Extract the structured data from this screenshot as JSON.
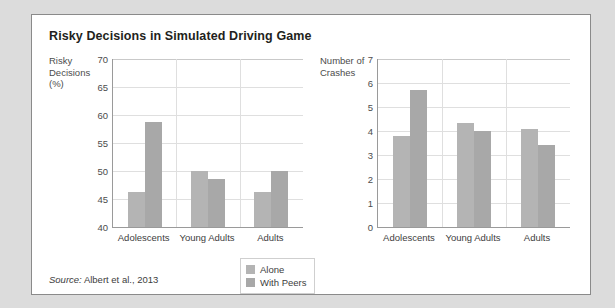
{
  "figure": {
    "title": "Risky Decisions in Simulated Driving Game",
    "source_label": "Source:",
    "source_text": "Albert et al., 2013"
  },
  "legend": {
    "position": "bottom-center",
    "entries": [
      {
        "label": "Alone",
        "color": "#b4b4b4",
        "swatch": "alone-swatch"
      },
      {
        "label": "With Peers",
        "color": "#a8a8a8",
        "swatch": "with-peers-swatch"
      }
    ]
  },
  "chart_data": [
    {
      "type": "bar",
      "title": "Risky Decisions in Simulated Driving Game",
      "panel": "left",
      "ylabel": "Risky\nDecisions\n(%)",
      "xlabel": "",
      "categories": [
        "Adolescents",
        "Young Adults",
        "Adults"
      ],
      "series": [
        {
          "name": "Alone",
          "values": [
            46.3,
            50.0,
            46.3
          ],
          "color": "#b4b4b4"
        },
        {
          "name": "With Peers",
          "values": [
            58.7,
            48.5,
            50.0
          ],
          "color": "#a8a8a8"
        }
      ],
      "ylim": [
        40,
        70
      ],
      "ytick_step": 5,
      "yticks": [
        70,
        65,
        60,
        55,
        50,
        45,
        40
      ],
      "grid": true,
      "legend": "bottom-center"
    },
    {
      "type": "bar",
      "panel": "right",
      "ylabel": "Number of\nCrashes",
      "xlabel": "",
      "categories": [
        "Adolescents",
        "Young Adults",
        "Adults"
      ],
      "series": [
        {
          "name": "Alone",
          "values": [
            3.8,
            4.35,
            4.1
          ],
          "color": "#b4b4b4"
        },
        {
          "name": "With Peers",
          "values": [
            5.7,
            4.0,
            3.4
          ],
          "color": "#a8a8a8"
        }
      ],
      "ylim": [
        0,
        7
      ],
      "ytick_step": 1,
      "yticks": [
        7,
        6,
        5,
        4,
        3,
        2,
        1,
        0
      ],
      "grid": true,
      "legend": "bottom-center"
    }
  ]
}
